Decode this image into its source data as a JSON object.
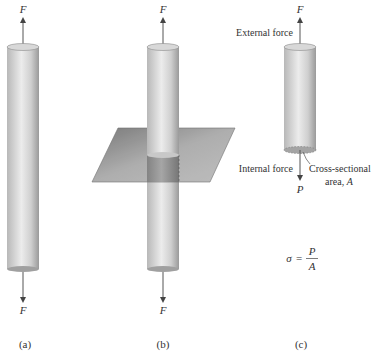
{
  "panels": [
    {
      "id": "a",
      "caption": "(a)",
      "top_force": "F",
      "bottom_force": "F"
    },
    {
      "id": "b",
      "caption": "(b)",
      "top_force": "F",
      "bottom_force": "F"
    },
    {
      "id": "c",
      "caption": "(c)",
      "top_force": "F",
      "bottom_force": "P"
    }
  ],
  "labels": {
    "external_force": "External force",
    "internal_force": "Internal force",
    "cross_section_line1": "Cross-sectional",
    "cross_section_line2": "area, ",
    "area_symbol": "A"
  },
  "equation": {
    "lhs": "σ",
    "equals": "=",
    "numerator": "P",
    "denominator": "A"
  },
  "colors": {
    "cylinder_light": "#e2e2e2",
    "cylinder_dark": "#9a9a9a",
    "plane": "#8c8c8c",
    "arrow": "#555555",
    "text": "#333333"
  }
}
